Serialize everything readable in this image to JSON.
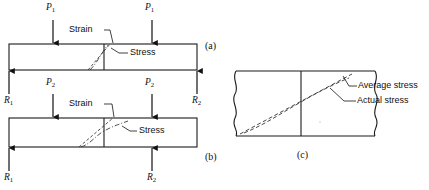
{
  "figure": {
    "title_absent": true,
    "panels": [
      {
        "id": "a",
        "id_label": "(a)",
        "description": "beam with two point loads P1 and reactions R1 R2",
        "loads": [
          {
            "name": "load-left",
            "label": "P",
            "subscript": "1"
          },
          {
            "name": "load-right",
            "label": "P",
            "subscript": "1"
          }
        ],
        "reactions": [
          {
            "name": "reaction-left",
            "label": "R",
            "subscript": "1"
          },
          {
            "name": "reaction-right",
            "label": "R",
            "subscript": "2"
          }
        ],
        "callouts": [
          {
            "name": "strain-callout",
            "label": "Strain"
          },
          {
            "name": "stress-callout",
            "label": "Stress"
          }
        ]
      },
      {
        "id": "b",
        "id_label": "(b)",
        "description": "beam with two larger point loads P2 and reactions R1 R2",
        "loads": [
          {
            "name": "load-left",
            "label": "P",
            "subscript": "2"
          },
          {
            "name": "load-right",
            "label": "P",
            "subscript": "2"
          }
        ],
        "reactions": [
          {
            "name": "reaction-left",
            "label": "R",
            "subscript": "1"
          },
          {
            "name": "reaction-right",
            "label": "R",
            "subscript": "2"
          }
        ],
        "callouts": [
          {
            "name": "strain-callout",
            "label": "Strain"
          },
          {
            "name": "stress-callout",
            "label": "Stress"
          }
        ]
      },
      {
        "id": "c",
        "id_label": "(c)",
        "description": "enlarged cross-section showing average versus actual stress distribution",
        "callouts": [
          {
            "name": "average-stress-callout",
            "label": "Average stress"
          },
          {
            "name": "actual-stress-callout",
            "label": "Actual stress"
          }
        ]
      }
    ]
  },
  "colors": {
    "line": "#1a1a1a",
    "background": "#ffffff",
    "dashed": "#333333"
  }
}
